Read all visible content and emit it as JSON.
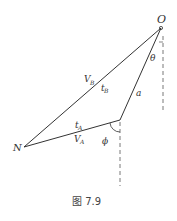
{
  "diagram": {
    "points": {
      "O": {
        "label": "O",
        "x": 161,
        "y": 28
      },
      "N": {
        "label": "N",
        "x": 24,
        "y": 147
      },
      "P": {
        "x": 120,
        "y": 120
      }
    },
    "edges": [
      {
        "from": "N",
        "to": "O",
        "labels": [
          "V",
          "B",
          "t",
          "B"
        ]
      },
      {
        "from": "N",
        "to": "P",
        "labels": [
          "t",
          "A",
          "V",
          "A"
        ]
      },
      {
        "from": "P",
        "to": "O",
        "label": "a"
      }
    ],
    "angles": {
      "theta": "θ",
      "phi": "ϕ"
    },
    "labels": {
      "O": "O",
      "N": "N",
      "VB_main": "V",
      "VB_sub": "B",
      "tB_main": "t",
      "tB_sub": "B",
      "tA_main": "t",
      "tA_sub": "A",
      "VA_main": "V",
      "VA_sub": "A",
      "a": "a",
      "theta": "θ",
      "phi": "ϕ"
    },
    "caption": "图 7.9",
    "colors": {
      "line": "#333333",
      "dash": "#555555",
      "text": "#333333"
    }
  }
}
